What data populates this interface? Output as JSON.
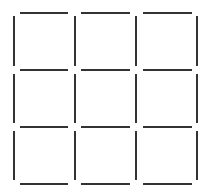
{
  "puzzle": {
    "type": "matchstick-grid",
    "rows": 3,
    "cols": 3,
    "stick_color": "#333333",
    "stick_width": 2,
    "background": "#ffffff",
    "horizontal_y": [
      13,
      70,
      127,
      184
    ],
    "horizontal_x_segments": [
      [
        20,
        68
      ],
      [
        81,
        130
      ],
      [
        143,
        192
      ]
    ],
    "vertical_x": [
      14,
      75,
      136,
      197
    ],
    "vertical_y_segments": [
      [
        16,
        66
      ],
      [
        74,
        123
      ],
      [
        131,
        180
      ]
    ],
    "total_sticks": 24
  }
}
